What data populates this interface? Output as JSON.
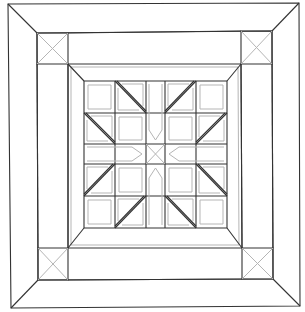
{
  "colors": {
    "background": "#ffffff",
    "line": "#333333",
    "guide": "#b5b5b5"
  },
  "outer_border": {
    "tl": [
      8,
      4
    ],
    "tr": [
      299,
      3
    ],
    "br": [
      300,
      306
    ],
    "bl": [
      11,
      308
    ]
  },
  "second_frame": {
    "tl": [
      37,
      33
    ],
    "tr": [
      272,
      31
    ],
    "br": [
      273,
      279
    ],
    "bl": [
      38,
      280
    ]
  },
  "third_frame": {
    "tl": [
      68,
      64
    ],
    "tr": [
      241,
      64
    ],
    "br": [
      242,
      248
    ],
    "bl": [
      68,
      248
    ]
  },
  "center_block": {
    "cols": [
      84,
      115,
      146,
      165,
      196,
      227
    ],
    "rows": [
      81,
      113,
      144,
      164,
      196,
      228
    ]
  },
  "corner_squares": 4,
  "center_grid": "5x5 star block with half-square triangles"
}
